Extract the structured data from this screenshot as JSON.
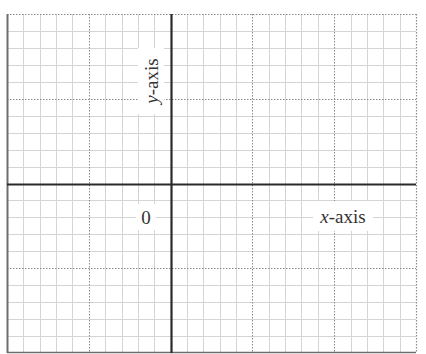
{
  "diagram": {
    "type": "coordinate-grid",
    "x_axis_label": {
      "variable": "x",
      "suffix": "-axis"
    },
    "y_axis_label": {
      "variable": "y",
      "suffix": "-axis"
    },
    "origin_label": "0",
    "grid": {
      "columns": 25,
      "rows": 20,
      "major_every": 5,
      "origin_column": 10,
      "origin_row": 10
    },
    "colors": {
      "background": "#ffffff",
      "minor_grid": "#d4d4d4",
      "major_grid": "#8a8a8a",
      "axis": "#2a2a2a",
      "border": "#6e6e6e",
      "text": "#333333"
    }
  }
}
